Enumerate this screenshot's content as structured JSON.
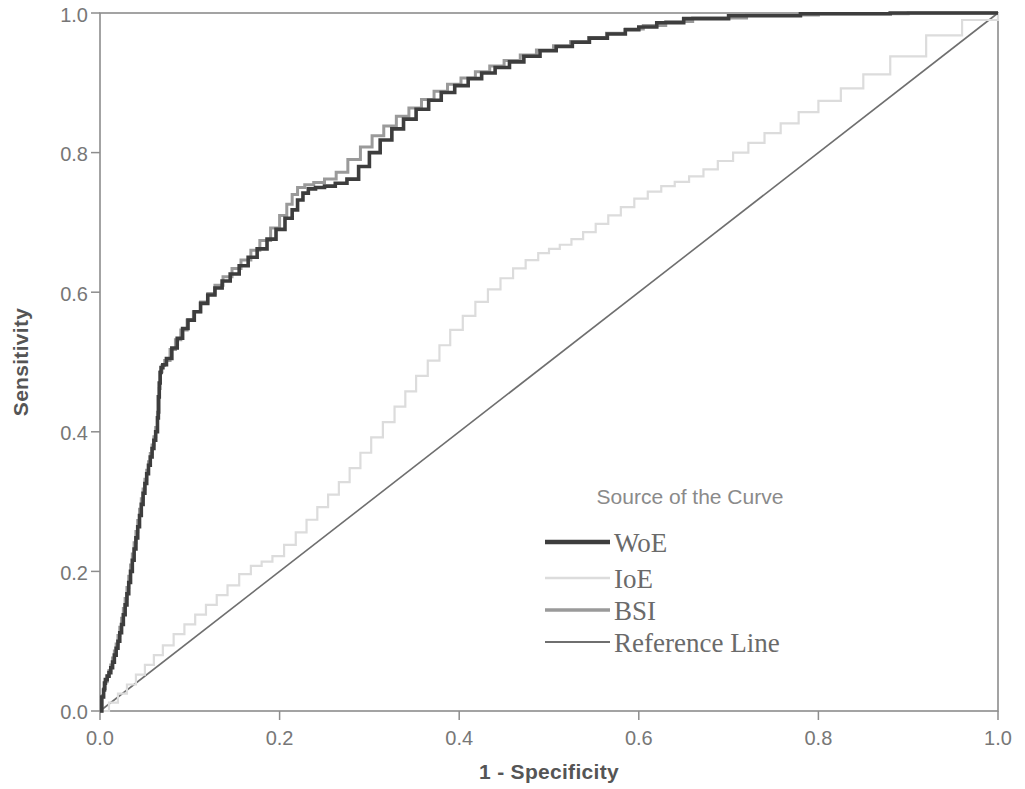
{
  "figure": {
    "kind": "roc-curve-plot",
    "background": "#ffffff"
  },
  "axes": {
    "x_title": "1 - Specificity",
    "y_title": "Sensitivity",
    "x_ticks": [
      "0.0",
      "0.2",
      "0.4",
      "0.6",
      "0.8",
      "1.0"
    ],
    "y_ticks": [
      "0.0",
      "0.2",
      "0.4",
      "0.6",
      "0.8",
      "1.0"
    ],
    "axis_color": "#8d8d8d",
    "label_color": "#777777",
    "title_color": "#555555"
  },
  "legend": {
    "title": "Source of the Curve",
    "title_color": "#8a8a8a",
    "label_color": "#6a6a6a",
    "items": [
      {
        "label": "WoE",
        "color": "#3d3d3d",
        "width": 3.6
      },
      {
        "label": "IoE",
        "color": "#dcdcdc",
        "width": 2.2
      },
      {
        "label": "BSI",
        "color": "#9a9a9a",
        "width": 3.0
      },
      {
        "label": "Reference Line",
        "color": "#6f6f6f",
        "width": 1.6
      }
    ]
  },
  "chart_data": {
    "type": "line",
    "title": "",
    "subtitle": "",
    "xlabel": "1 - Specificity",
    "ylabel": "Sensitivity",
    "xlim": [
      0.0,
      1.0
    ],
    "ylim": [
      0.0,
      1.0
    ],
    "xticks": [
      0.0,
      0.2,
      0.4,
      0.6,
      0.8,
      1.0
    ],
    "yticks": [
      0.0,
      0.2,
      0.4,
      0.6,
      0.8,
      1.0
    ],
    "grid": false,
    "legend_title": "Source of the Curve",
    "legend_position": "inside-lower-right",
    "annotations": [],
    "series": [
      {
        "name": "WoE",
        "color": "#3d3d3d",
        "linewidth": 3.6,
        "x": [
          0.0,
          0.002,
          0.004,
          0.005,
          0.006,
          0.008,
          0.01,
          0.012,
          0.014,
          0.016,
          0.018,
          0.02,
          0.022,
          0.024,
          0.026,
          0.028,
          0.03,
          0.032,
          0.034,
          0.036,
          0.038,
          0.04,
          0.042,
          0.044,
          0.046,
          0.048,
          0.05,
          0.052,
          0.054,
          0.056,
          0.058,
          0.06,
          0.062,
          0.064,
          0.065,
          0.066,
          0.067,
          0.068,
          0.07,
          0.074,
          0.08,
          0.086,
          0.092,
          0.098,
          0.105,
          0.112,
          0.12,
          0.128,
          0.136,
          0.145,
          0.155,
          0.165,
          0.175,
          0.186,
          0.196,
          0.206,
          0.214,
          0.22,
          0.226,
          0.232,
          0.24,
          0.25,
          0.262,
          0.275,
          0.288,
          0.3,
          0.312,
          0.325,
          0.338,
          0.352,
          0.366,
          0.38,
          0.395,
          0.41,
          0.425,
          0.44,
          0.456,
          0.472,
          0.49,
          0.508,
          0.526,
          0.545,
          0.565,
          0.585,
          0.6,
          0.62,
          0.65,
          0.7,
          0.78,
          0.88,
          1.0
        ],
        "y": [
          0.0,
          0.02,
          0.03,
          0.04,
          0.045,
          0.05,
          0.055,
          0.062,
          0.07,
          0.08,
          0.09,
          0.1,
          0.112,
          0.124,
          0.138,
          0.152,
          0.168,
          0.184,
          0.2,
          0.216,
          0.232,
          0.248,
          0.264,
          0.28,
          0.296,
          0.312,
          0.326,
          0.34,
          0.352,
          0.364,
          0.376,
          0.388,
          0.4,
          0.42,
          0.45,
          0.47,
          0.485,
          0.492,
          0.496,
          0.505,
          0.52,
          0.534,
          0.548,
          0.56,
          0.572,
          0.584,
          0.596,
          0.606,
          0.616,
          0.626,
          0.638,
          0.65,
          0.662,
          0.676,
          0.69,
          0.706,
          0.718,
          0.732,
          0.742,
          0.748,
          0.75,
          0.752,
          0.756,
          0.762,
          0.78,
          0.8,
          0.818,
          0.834,
          0.848,
          0.862,
          0.875,
          0.886,
          0.896,
          0.906,
          0.914,
          0.922,
          0.93,
          0.938,
          0.946,
          0.952,
          0.958,
          0.964,
          0.97,
          0.976,
          0.98,
          0.986,
          0.992,
          0.996,
          0.999,
          1.0,
          1.0
        ]
      },
      {
        "name": "BSI",
        "color": "#9a9a9a",
        "linewidth": 3.0,
        "x": [
          0.0,
          0.002,
          0.004,
          0.006,
          0.008,
          0.01,
          0.012,
          0.014,
          0.016,
          0.018,
          0.02,
          0.022,
          0.024,
          0.026,
          0.028,
          0.03,
          0.032,
          0.034,
          0.036,
          0.038,
          0.04,
          0.042,
          0.044,
          0.046,
          0.048,
          0.05,
          0.052,
          0.054,
          0.056,
          0.058,
          0.06,
          0.062,
          0.064,
          0.066,
          0.067,
          0.069,
          0.072,
          0.078,
          0.084,
          0.09,
          0.097,
          0.104,
          0.112,
          0.12,
          0.128,
          0.137,
          0.147,
          0.157,
          0.168,
          0.178,
          0.19,
          0.2,
          0.208,
          0.214,
          0.22,
          0.228,
          0.238,
          0.25,
          0.263,
          0.276,
          0.29,
          0.303,
          0.316,
          0.33,
          0.344,
          0.358,
          0.372,
          0.387,
          0.402,
          0.418,
          0.434,
          0.45,
          0.468,
          0.486,
          0.505,
          0.524,
          0.544,
          0.564,
          0.585,
          0.605,
          0.63,
          0.66,
          0.72,
          0.8,
          0.9,
          1.0
        ],
        "y": [
          0.0,
          0.022,
          0.032,
          0.042,
          0.05,
          0.058,
          0.066,
          0.076,
          0.086,
          0.096,
          0.108,
          0.12,
          0.133,
          0.147,
          0.161,
          0.177,
          0.193,
          0.209,
          0.225,
          0.241,
          0.257,
          0.273,
          0.289,
          0.304,
          0.318,
          0.332,
          0.345,
          0.357,
          0.369,
          0.381,
          0.393,
          0.406,
          0.428,
          0.462,
          0.486,
          0.495,
          0.502,
          0.518,
          0.532,
          0.546,
          0.56,
          0.572,
          0.586,
          0.598,
          0.61,
          0.622,
          0.634,
          0.646,
          0.66,
          0.674,
          0.692,
          0.71,
          0.726,
          0.74,
          0.75,
          0.754,
          0.757,
          0.762,
          0.772,
          0.79,
          0.808,
          0.824,
          0.838,
          0.852,
          0.864,
          0.876,
          0.888,
          0.898,
          0.907,
          0.916,
          0.924,
          0.932,
          0.94,
          0.947,
          0.953,
          0.959,
          0.965,
          0.971,
          0.977,
          0.982,
          0.988,
          0.993,
          0.997,
          0.999,
          1.0,
          1.0
        ]
      },
      {
        "name": "IoE",
        "color": "#dcdcdc",
        "linewidth": 2.2,
        "x": [
          0.0,
          0.01,
          0.02,
          0.03,
          0.04,
          0.05,
          0.06,
          0.07,
          0.082,
          0.094,
          0.106,
          0.118,
          0.13,
          0.142,
          0.155,
          0.168,
          0.18,
          0.192,
          0.205,
          0.218,
          0.23,
          0.242,
          0.254,
          0.266,
          0.278,
          0.29,
          0.302,
          0.315,
          0.328,
          0.34,
          0.352,
          0.365,
          0.378,
          0.39,
          0.404,
          0.418,
          0.432,
          0.446,
          0.46,
          0.474,
          0.488,
          0.5,
          0.512,
          0.525,
          0.538,
          0.552,
          0.566,
          0.58,
          0.595,
          0.61,
          0.625,
          0.64,
          0.656,
          0.672,
          0.688,
          0.705,
          0.722,
          0.74,
          0.758,
          0.778,
          0.8,
          0.825,
          0.85,
          0.88,
          0.92,
          0.96,
          1.0
        ],
        "y": [
          0.0,
          0.012,
          0.025,
          0.038,
          0.052,
          0.066,
          0.08,
          0.094,
          0.11,
          0.124,
          0.138,
          0.152,
          0.166,
          0.18,
          0.196,
          0.208,
          0.214,
          0.222,
          0.238,
          0.256,
          0.274,
          0.292,
          0.31,
          0.328,
          0.348,
          0.37,
          0.392,
          0.414,
          0.436,
          0.458,
          0.48,
          0.502,
          0.524,
          0.546,
          0.566,
          0.586,
          0.604,
          0.62,
          0.634,
          0.646,
          0.656,
          0.662,
          0.668,
          0.676,
          0.686,
          0.698,
          0.71,
          0.722,
          0.734,
          0.744,
          0.752,
          0.758,
          0.766,
          0.776,
          0.788,
          0.8,
          0.814,
          0.828,
          0.842,
          0.858,
          0.874,
          0.892,
          0.912,
          0.938,
          0.968,
          0.99,
          1.0
        ]
      },
      {
        "name": "Reference Line",
        "color": "#6f6f6f",
        "linewidth": 1.6,
        "x": [
          0.0,
          1.0
        ],
        "y": [
          0.0,
          1.0
        ]
      }
    ]
  },
  "plot_geometry": {
    "left": 100,
    "top": 13,
    "right": 998,
    "bottom": 711
  }
}
